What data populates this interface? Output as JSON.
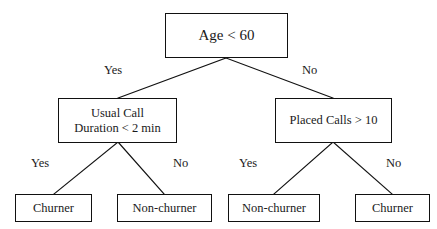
{
  "diagram": {
    "type": "decision-tree",
    "background_color": "#ffffff",
    "stroke_color": "#111111",
    "text_color": "#1a1a1a"
  },
  "nodes": {
    "root": {
      "label": "Age < 60",
      "kind": "decision"
    },
    "internal_left": {
      "label": "Usual Call\nDuration < 2 min",
      "kind": "decision"
    },
    "internal_right": {
      "label": "Placed Calls > 10",
      "kind": "decision"
    },
    "leaves": [
      {
        "label": "Churner",
        "kind": "leaf"
      },
      {
        "label": "Non-churner",
        "kind": "leaf"
      },
      {
        "label": "Non-churner",
        "kind": "leaf"
      },
      {
        "label": "Churner",
        "kind": "leaf"
      }
    ]
  },
  "edge_labels": {
    "root_yes": "Yes",
    "root_no": "No",
    "left_yes": "Yes",
    "left_no": "No",
    "right_yes": "Yes",
    "right_no": "No"
  }
}
